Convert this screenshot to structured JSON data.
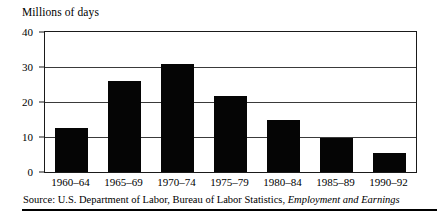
{
  "figure": {
    "title": "Millions of days",
    "source_prefix": "Source: U.S. Department of Labor, Bureau of Labor Statistics, ",
    "source_publication": "Employment and Earnings",
    "bar_color": "#050505",
    "axis_color": "#1a1a1a",
    "gridline_color": "#3a3a3a"
  },
  "chart_data": {
    "type": "bar",
    "title": "Millions of days",
    "xlabel": "",
    "ylabel": "Millions of days",
    "categories": [
      "1960–64",
      "1965–69",
      "1970–74",
      "1975–79",
      "1980–84",
      "1985–89",
      "1990–92"
    ],
    "values": [
      12.5,
      26.0,
      31.0,
      21.8,
      15.0,
      9.7,
      5.5
    ],
    "ylim": [
      0,
      40
    ],
    "yticks": [
      0,
      10,
      20,
      30,
      40
    ],
    "ytick_labels": [
      "0",
      "10",
      "20",
      "30",
      "40"
    ],
    "grid": true,
    "legend": "none",
    "series": [
      {
        "name": "Millions of days",
        "values": [
          12.5,
          26.0,
          31.0,
          21.8,
          15.0,
          9.7,
          5.5
        ]
      }
    ]
  }
}
